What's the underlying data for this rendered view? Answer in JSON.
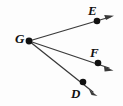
{
  "figure": {
    "type": "geometry-diagram",
    "background_color": "#fdfdfd",
    "stroke_color": "#3a3a3a",
    "point_color": "#111111",
    "label_color": "#111111",
    "vertex": {
      "id": "G",
      "label": "G",
      "x": 29,
      "y": 41,
      "label_x": 15,
      "label_y": 33,
      "dot_radius": 3.2
    },
    "rays": [
      {
        "id": "ray-GE",
        "name": "ray-g-e",
        "endpoint_label": "E",
        "from_x": 29,
        "from_y": 41,
        "to_x": 97,
        "to_y": 21,
        "arrow_tip_x": 113,
        "arrow_tip_y": 16,
        "dot_x": 97,
        "dot_y": 21,
        "dot_radius": 3.2,
        "label_x": 88,
        "label_y": 4
      },
      {
        "id": "ray-GF",
        "name": "ray-g-f",
        "endpoint_label": "F",
        "from_x": 29,
        "from_y": 41,
        "to_x": 98,
        "to_y": 63,
        "arrow_tip_x": 112,
        "arrow_tip_y": 70,
        "dot_x": 98,
        "dot_y": 63,
        "dot_radius": 3.2,
        "label_x": 90,
        "label_y": 46
      },
      {
        "id": "ray-GD",
        "name": "ray-g-d",
        "endpoint_label": "D",
        "from_x": 29,
        "from_y": 41,
        "to_x": 83,
        "to_y": 82,
        "arrow_tip_x": 97,
        "arrow_tip_y": 96,
        "dot_x": 83,
        "dot_y": 82,
        "dot_radius": 3.2,
        "label_x": 71,
        "label_y": 87
      }
    ],
    "labels": {
      "vertex": "G",
      "e": "E",
      "f": "F",
      "d": "D"
    }
  }
}
